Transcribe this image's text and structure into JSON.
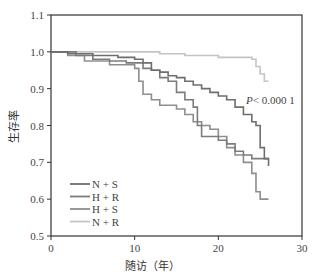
{
  "chart_data": {
    "type": "line",
    "subtype": "kaplan-meier step",
    "title": "",
    "xlabel": "随访（年）",
    "ylabel": "生存率",
    "xlim": [
      0,
      30
    ],
    "ylim": [
      0.5,
      1.1
    ],
    "x_ticks": [
      "0",
      "10",
      "20",
      "30"
    ],
    "y_ticks": [
      "0.5",
      "0.6",
      "0.7",
      "0.8",
      "0.9",
      "1.0",
      "1.1"
    ],
    "grid": false,
    "legend_position": "lower-left",
    "annotation": "P< 0.000 1",
    "series": [
      {
        "name": "N + S",
        "color": "#6e6e6e",
        "points": [
          [
            0,
            1.0
          ],
          [
            2,
            0.995
          ],
          [
            5,
            0.99
          ],
          [
            8,
            0.985
          ],
          [
            10,
            0.98
          ],
          [
            11,
            0.97
          ],
          [
            12,
            0.95
          ],
          [
            13,
            0.945
          ],
          [
            14,
            0.935
          ],
          [
            15,
            0.93
          ],
          [
            16,
            0.92
          ],
          [
            17,
            0.91
          ],
          [
            18,
            0.9
          ],
          [
            19,
            0.89
          ],
          [
            20,
            0.88
          ],
          [
            21,
            0.87
          ],
          [
            22,
            0.85
          ],
          [
            23,
            0.83
          ],
          [
            24,
            0.81
          ],
          [
            24.5,
            0.8
          ],
          [
            25,
            0.74
          ],
          [
            25.5,
            0.71
          ],
          [
            26,
            0.69
          ]
        ]
      },
      {
        "name": "H + R",
        "color": "#7c7c7c",
        "points": [
          [
            0,
            1.0
          ],
          [
            3,
            0.99
          ],
          [
            5,
            0.98
          ],
          [
            7,
            0.975
          ],
          [
            9,
            0.97
          ],
          [
            11,
            0.955
          ],
          [
            12,
            0.95
          ],
          [
            13,
            0.93
          ],
          [
            14,
            0.92
          ],
          [
            15,
            0.89
          ],
          [
            16,
            0.87
          ],
          [
            17,
            0.85
          ],
          [
            17.5,
            0.8
          ],
          [
            18,
            0.77
          ],
          [
            20,
            0.76
          ],
          [
            21,
            0.75
          ],
          [
            22,
            0.73
          ],
          [
            23,
            0.72
          ],
          [
            24,
            0.71
          ],
          [
            26,
            0.71
          ]
        ]
      },
      {
        "name": "H + S",
        "color": "#8e8e8e",
        "points": [
          [
            0,
            1.0
          ],
          [
            2,
            0.99
          ],
          [
            4,
            0.975
          ],
          [
            7,
            0.965
          ],
          [
            10,
            0.955
          ],
          [
            10.5,
            0.92
          ],
          [
            11,
            0.885
          ],
          [
            12,
            0.87
          ],
          [
            13,
            0.855
          ],
          [
            15,
            0.845
          ],
          [
            16,
            0.83
          ],
          [
            17,
            0.81
          ],
          [
            18,
            0.8
          ],
          [
            19,
            0.79
          ],
          [
            20,
            0.77
          ],
          [
            21,
            0.74
          ],
          [
            22,
            0.72
          ],
          [
            23,
            0.7
          ],
          [
            24,
            0.67
          ],
          [
            24.5,
            0.62
          ],
          [
            25,
            0.6
          ],
          [
            26,
            0.6
          ]
        ]
      },
      {
        "name": "N + R",
        "color": "#c4c4c4",
        "points": [
          [
            0,
            1.0
          ],
          [
            10,
            1.0
          ],
          [
            13,
            0.995
          ],
          [
            16,
            0.99
          ],
          [
            20,
            0.985
          ],
          [
            24,
            0.98
          ],
          [
            24.5,
            0.96
          ],
          [
            25,
            0.94
          ],
          [
            25.5,
            0.92
          ],
          [
            26,
            0.92
          ]
        ]
      }
    ]
  },
  "legend": {
    "items": [
      {
        "label": "N + S",
        "color": "#6e6e6e"
      },
      {
        "label": "H + R",
        "color": "#7c7c7c"
      },
      {
        "label": "H + S",
        "color": "#8e8e8e"
      },
      {
        "label": "N + R",
        "color": "#c4c4c4"
      }
    ]
  },
  "labels": {
    "xlabel": "随访（年）",
    "ylabel": "生存率",
    "pvalue": "P< 0.000 1"
  },
  "ticks": {
    "x": [
      "0",
      "10",
      "20",
      "30"
    ],
    "y": [
      "0.5",
      "0.6",
      "0.7",
      "0.8",
      "0.9",
      "1.0",
      "1.1"
    ]
  }
}
